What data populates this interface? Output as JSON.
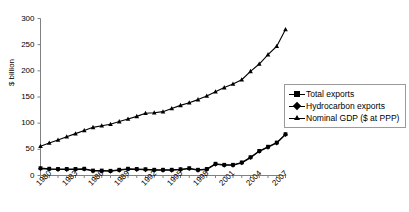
{
  "chart_data": {
    "type": "line",
    "title": "",
    "xlabel": "",
    "ylabel": "$ billion",
    "ylim": [
      0,
      300
    ],
    "yticks": [
      0,
      50,
      100,
      150,
      200,
      250,
      300
    ],
    "xlim": [
      1980,
      2008
    ],
    "xticks": [
      1980,
      1983,
      1986,
      1989,
      1992,
      1995,
      1998,
      2001,
      2004,
      2007
    ],
    "x": [
      1980,
      1981,
      1982,
      1983,
      1984,
      1985,
      1986,
      1987,
      1988,
      1989,
      1990,
      1991,
      1992,
      1993,
      1994,
      1995,
      1996,
      1997,
      1998,
      1999,
      2000,
      2001,
      2002,
      2003,
      2004,
      2005,
      2006,
      2007,
      2008
    ],
    "grid": false,
    "legend_position": "right",
    "series": [
      {
        "name": "Total exports",
        "marker": "square",
        "color": "#000000",
        "values": [
          14,
          13,
          12.5,
          12.5,
          12.5,
          13,
          9.5,
          9.5,
          9,
          11,
          13,
          12.5,
          12,
          11,
          11,
          11,
          12,
          14,
          11,
          12.5,
          22.5,
          20.5,
          20.5,
          25,
          35,
          47,
          55,
          63,
          79
        ]
      },
      {
        "name": "Hydrocarbon exports",
        "marker": "diamond",
        "color": "#000000",
        "values": [
          13,
          12,
          11.5,
          11.5,
          11.5,
          12,
          8.5,
          8.5,
          8,
          10,
          12,
          11.5,
          11,
          10,
          10,
          10,
          11,
          13,
          10,
          11.5,
          21.5,
          19.5,
          19.5,
          24,
          34,
          46,
          54,
          62,
          78
        ]
      },
      {
        "name": "Nominal GDP ($ at PPP)",
        "marker": "triangle",
        "color": "#000000",
        "values": [
          56,
          62,
          68,
          74,
          80,
          86,
          92,
          95,
          98,
          103,
          108,
          113,
          119,
          120,
          122,
          128,
          134,
          139,
          145,
          152,
          160,
          168,
          175,
          183,
          199,
          213,
          231,
          247,
          279
        ]
      }
    ]
  },
  "axis": {
    "y_title": "$ billion",
    "y_tick_labels": [
      "300",
      "250",
      "200",
      "150",
      "100",
      "50",
      "0"
    ],
    "x_tick_labels": [
      "1980",
      "1983",
      "1986",
      "1989",
      "1992",
      "1995",
      "1998",
      "2001",
      "2004",
      "2007"
    ]
  },
  "legend": {
    "items": [
      {
        "label": "Total exports",
        "marker": "square-marker"
      },
      {
        "label": "Hydrocarbon exports",
        "marker": "diamond-marker"
      },
      {
        "label": "Nominal GDP ($ at PPP)",
        "marker": "triangle-marker"
      }
    ]
  }
}
